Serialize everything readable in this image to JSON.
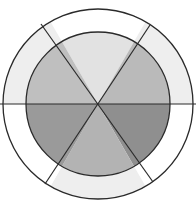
{
  "diagram": {
    "type": "concentric-sector-wheel",
    "center": [
      98,
      104
    ],
    "outer_radius": 95,
    "inner_radius": 72,
    "stroke_color": "#2a2a2a",
    "background": "#ffffff",
    "sector_count": 6,
    "inner_sectors": [
      {
        "position": "top",
        "start_deg": 240,
        "end_deg": 300,
        "fill": "#e2e2e2"
      },
      {
        "position": "upper-right",
        "start_deg": 300,
        "end_deg": 360,
        "fill": "#bababa"
      },
      {
        "position": "lower-right",
        "start_deg": 0,
        "end_deg": 60,
        "fill": "#8f8f8f"
      },
      {
        "position": "bottom",
        "start_deg": 60,
        "end_deg": 120,
        "fill": "#b3b3b3"
      },
      {
        "position": "lower-left",
        "start_deg": 120,
        "end_deg": 180,
        "fill": "#9a9a9a"
      },
      {
        "position": "upper-left",
        "start_deg": 180,
        "end_deg": 240,
        "fill": "#bfbfbf"
      }
    ],
    "outer_ring_segments": [
      {
        "position": "top",
        "start_deg": 240,
        "end_deg": 300,
        "fill": "#ffffff"
      },
      {
        "position": "upper-right",
        "start_deg": 300,
        "end_deg": 360,
        "fill": "#eeeeee"
      },
      {
        "position": "lower-right",
        "start_deg": 0,
        "end_deg": 60,
        "fill": "#ffffff"
      },
      {
        "position": "bottom",
        "start_deg": 60,
        "end_deg": 120,
        "fill": "#eeeeee"
      },
      {
        "position": "lower-left",
        "start_deg": 120,
        "end_deg": 180,
        "fill": "#ffffff"
      },
      {
        "position": "upper-left",
        "start_deg": 180,
        "end_deg": 240,
        "fill": "#eeeeee"
      }
    ],
    "divider_lines": [
      {
        "name": "horizontal",
        "x1": 0,
        "y1": 104,
        "x2": 196,
        "y2": 104
      },
      {
        "name": "diagonal-down",
        "x1": 41,
        "y1": 24,
        "x2": 153,
        "y2": 182
      },
      {
        "name": "diagonal-up",
        "x1": 150,
        "y1": 25,
        "x2": 45,
        "y2": 184
      }
    ]
  }
}
